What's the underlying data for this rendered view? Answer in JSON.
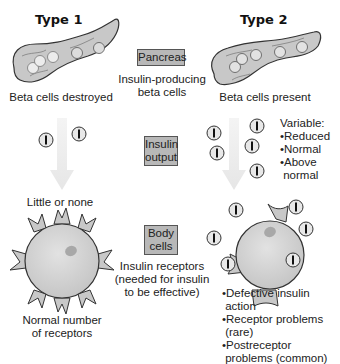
{
  "columns": {
    "type1": {
      "title": "Type 1",
      "pancreas_caption": "Beta cells destroyed",
      "insulin_caption": "Little or none",
      "cell_caption_line1": "Normal number",
      "cell_caption_line2": "of receptors"
    },
    "type2": {
      "title": "Type 2",
      "pancreas_caption": "Beta cells present",
      "insulin_caption": {
        "title": "Variable:",
        "items": [
          "Reduced",
          "Normal",
          "Above",
          "normal"
        ]
      },
      "cell_notes": [
        {
          "line1": "Defective insulin",
          "line2": "action"
        },
        {
          "line1": "Receptor problems",
          "line2": "(rare)"
        },
        {
          "line1": "Postreceptor",
          "line2": "problems (common)"
        }
      ]
    }
  },
  "center": {
    "pancreas": {
      "box_label": "Pancreas",
      "caption_line1": "Insulin-producing",
      "caption_line2": "beta cells"
    },
    "insulin_output": {
      "box_line1": "Insulin",
      "box_line2": "output"
    },
    "body_cells": {
      "box_line1": "Body",
      "box_line2": "cells",
      "caption_line1": "Insulin receptors",
      "caption_line2": "(needed for insulin",
      "caption_line3": "to be effective)"
    }
  },
  "icons": {
    "insulin_symbol": "I"
  },
  "colors": {
    "box_fill": "#b8b8b8",
    "organ_fill": "#c8c8c8",
    "cell_fill": "#d4d4d4",
    "arrow_fill": "#eeeeee"
  }
}
